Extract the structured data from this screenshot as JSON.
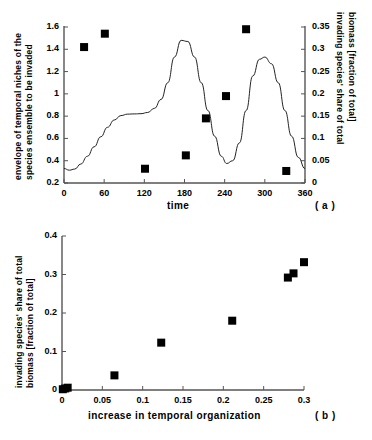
{
  "figure": {
    "panels": [
      {
        "id": "a",
        "label": "( a )",
        "xaxis": {
          "title": "time",
          "ticks": [
            "0",
            "60",
            "120",
            "180",
            "240",
            "300",
            "360"
          ],
          "values": [
            0,
            60,
            120,
            180,
            240,
            300,
            360
          ],
          "min": 0,
          "max": 360
        },
        "yaxis_left": {
          "title_line1": "envelope of temporal niches of the",
          "title_line2": "species ensemble to be invaded",
          "ticks": [
            "0.2",
            "0.4",
            "0.6",
            "0.8",
            "1",
            "1.2",
            "1.4",
            "1.6"
          ],
          "values": [
            0.2,
            0.4,
            0.6,
            0.8,
            1.0,
            1.2,
            1.4,
            1.6
          ],
          "min": 0.2,
          "max": 1.6
        },
        "yaxis_right": {
          "title_line1": "invading species' share of total",
          "title_line2": "biomass [fraction of total]",
          "ticks": [
            "0",
            "0.05",
            "0.1",
            "0.15",
            "0.2",
            "0.25",
            "0.3",
            "0.35"
          ],
          "values": [
            0,
            0.05,
            0.1,
            0.15,
            0.2,
            0.25,
            0.3,
            0.35
          ],
          "min": 0,
          "max": 0.35
        }
      },
      {
        "id": "b",
        "label": "( b )",
        "xaxis": {
          "title": "increase in temporal organization",
          "ticks": [
            "0",
            "0.05",
            "0.1",
            "0.15",
            "0.2",
            "0.25",
            "0.3"
          ],
          "values": [
            0,
            0.05,
            0.1,
            0.15,
            0.2,
            0.25,
            0.3
          ],
          "min": 0,
          "max": 0.3
        },
        "yaxis": {
          "title_line1": "invading species' share of total",
          "title_line2": "biomass [fraction of total]",
          "ticks": [
            "0",
            "0.1",
            "0.2",
            "0.3",
            "0.4"
          ],
          "values": [
            0,
            0.1,
            0.2,
            0.3,
            0.4
          ],
          "min": 0,
          "max": 0.4
        }
      }
    ]
  },
  "chart_data": [
    {
      "type": "line",
      "panel": "a",
      "title": "",
      "xlabel": "time",
      "ylabel": "envelope of temporal niches of the species ensemble to be invaded",
      "ylabel_right": "invading species' share of total biomass [fraction of total]",
      "xlim": [
        0,
        360
      ],
      "ylim": [
        0.2,
        1.6
      ],
      "ylim_right": [
        0,
        0.35
      ],
      "grid": false,
      "legend": "none",
      "series": [
        {
          "name": "envelope of temporal niches",
          "type": "line",
          "axis": "left",
          "x": [
            0,
            8,
            16,
            25,
            35,
            45,
            55,
            65,
            75,
            85,
            95,
            105,
            115,
            125,
            135,
            145,
            155,
            165,
            175,
            185,
            195,
            205,
            215,
            225,
            235,
            243,
            252,
            262,
            272,
            282,
            292,
            300,
            310,
            320,
            330,
            340,
            350,
            360
          ],
          "y": [
            0.33,
            0.315,
            0.325,
            0.37,
            0.44,
            0.525,
            0.615,
            0.7,
            0.765,
            0.805,
            0.818,
            0.82,
            0.822,
            0.833,
            0.87,
            0.95,
            1.1,
            1.33,
            1.48,
            1.47,
            1.33,
            1.1,
            0.85,
            0.62,
            0.44,
            0.375,
            0.4,
            0.56,
            0.85,
            1.16,
            1.31,
            1.33,
            1.27,
            1.1,
            0.85,
            0.62,
            0.43,
            0.33
          ]
        },
        {
          "name": "invading species' share of total biomass",
          "type": "scatter",
          "axis": "right",
          "x": [
            30,
            61,
            121,
            182,
            212,
            242,
            272,
            332
          ],
          "y": [
            0.305,
            0.335,
            0.032,
            0.062,
            0.145,
            0.195,
            0.345,
            0.027
          ]
        }
      ]
    },
    {
      "type": "scatter",
      "panel": "b",
      "title": "",
      "xlabel": "increase in temporal organization",
      "ylabel": "invading species' share of total biomass [fraction of total]",
      "xlim": [
        0,
        0.3
      ],
      "ylim": [
        0,
        0.4
      ],
      "grid": false,
      "legend": "none",
      "series": [
        {
          "name": "invading species' share of total biomass",
          "x": [
            0.001,
            0.004,
            0.007,
            0.065,
            0.123,
            0.211,
            0.28,
            0.287,
            0.3
          ],
          "y": [
            0.002,
            0.004,
            0.006,
            0.038,
            0.123,
            0.18,
            0.292,
            0.303,
            0.332
          ]
        }
      ]
    }
  ]
}
